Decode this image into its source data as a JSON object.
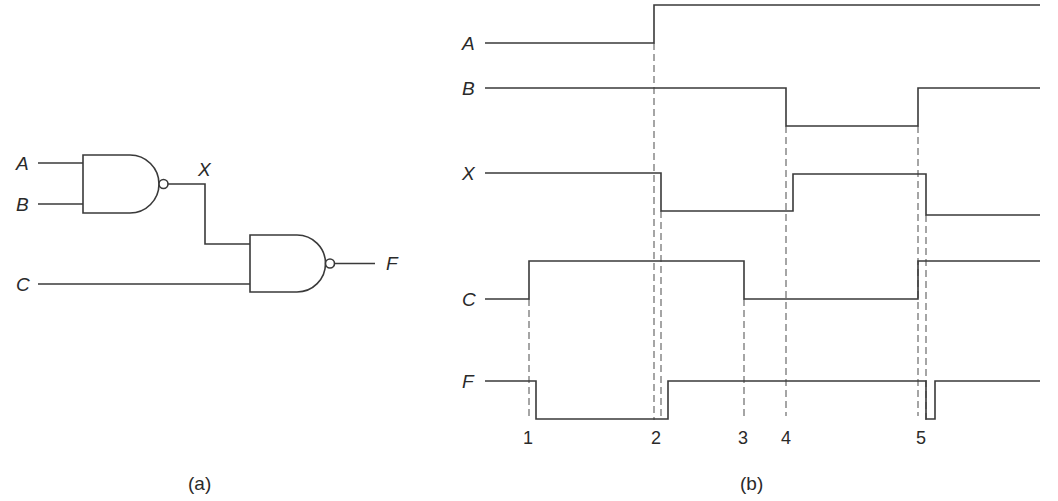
{
  "panel_a": {
    "caption": "(a)",
    "inputs": {
      "a": "A",
      "b": "B",
      "c": "C"
    },
    "intermediate": "X",
    "output": "F",
    "gates": [
      {
        "type": "NAND",
        "inputs": [
          "A",
          "B"
        ],
        "output": "X"
      },
      {
        "type": "NAND",
        "inputs": [
          "X",
          "C"
        ],
        "output": "F"
      }
    ]
  },
  "panel_b": {
    "caption": "(b)",
    "signals": [
      {
        "name": "A",
        "initial": 0,
        "transitions_at": [
          "2"
        ]
      },
      {
        "name": "B",
        "initial": 1,
        "transitions_at": [
          "4",
          "5"
        ]
      },
      {
        "name": "X",
        "initial": 1,
        "transitions_at": [
          "2 (delayed)",
          "4 (delayed)",
          "5 (delayed)"
        ]
      },
      {
        "name": "C",
        "initial": 0,
        "transitions_at": [
          "1",
          "3",
          "5"
        ]
      },
      {
        "name": "F",
        "initial": 1,
        "transitions_at": [
          "1 (delayed)",
          "2 (delayed)",
          "5 (glitch)"
        ]
      }
    ],
    "time_markers": [
      "1",
      "2",
      "3",
      "4",
      "5"
    ]
  }
}
